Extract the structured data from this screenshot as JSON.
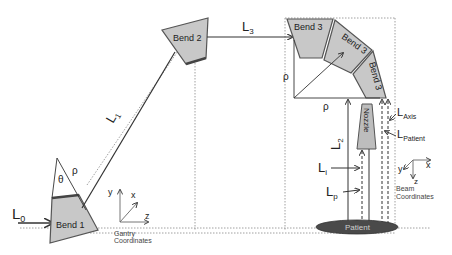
{
  "bends": {
    "bend1": "Bend 1",
    "bend2": "Bend 2",
    "bend3a": "Bend 3",
    "bend3b": "Bend 3",
    "bend3c": "Bend 3"
  },
  "labels": {
    "L0": "L",
    "L0_sub": "0",
    "L1": "L",
    "L1_sub": "1",
    "L2": "L",
    "L2_sub": "2",
    "L3": "L",
    "L3_sub": "3",
    "Li": "L",
    "Li_sub": "i",
    "Lp": "L",
    "Lp_sub": "p",
    "LAxis": "L",
    "LAxis_sub": "Axis",
    "LPatient": "L",
    "LPatient_sub": "Patient",
    "theta": "θ",
    "rho1": "ρ",
    "rho_v": "ρ",
    "rho_h": "ρ"
  },
  "nozzle": "Nozzle",
  "patient": "Patient",
  "gantry_coords": {
    "y": "y",
    "x": "x",
    "z": "z",
    "caption1": "Gantry",
    "caption2": "Coordinates"
  },
  "beam_coords": {
    "y": "y",
    "x": "x",
    "z": "z",
    "caption1": "Beam",
    "caption2": "Coordinates"
  },
  "colors": {
    "magnet_fill": "#c8c8c8",
    "magnet_edge": "#555555",
    "patient_fill": "#4a4a4a",
    "nozzle_fill": "#bdbdbd"
  }
}
